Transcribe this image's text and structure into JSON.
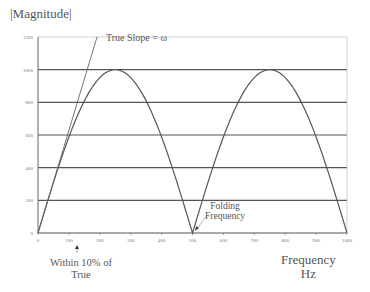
{
  "chart_data": {
    "type": "line",
    "title": "|Magnitude|",
    "xlabel": "Frequency Hz",
    "ylabel": "|Magnitude|",
    "xlim": [
      0,
      1000
    ],
    "ylim": [
      0,
      1200
    ],
    "x_ticks": [
      0,
      100,
      200,
      300,
      400,
      500,
      600,
      700,
      800,
      900,
      1000
    ],
    "y_ticks": [
      0,
      200,
      400,
      600,
      800,
      1000,
      1200
    ],
    "grid": {
      "horizontal": true,
      "vertical": false
    },
    "series": [
      {
        "name": "Aliased magnitude |1000·sin(2πf/1000)|",
        "x": [
          0,
          50,
          100,
          150,
          200,
          250,
          300,
          350,
          400,
          450,
          500,
          550,
          600,
          650,
          700,
          750,
          800,
          850,
          900,
          950,
          1000
        ],
        "values": [
          0,
          309,
          588,
          809,
          951,
          1000,
          951,
          809,
          588,
          309,
          0,
          309,
          588,
          809,
          951,
          1000,
          951,
          809,
          588,
          309,
          0
        ]
      },
      {
        "name": "True Slope = ω",
        "x": [
          0,
          191
        ],
        "values": [
          0,
          1200
        ]
      }
    ],
    "annotations": [
      {
        "text": "True Slope = ω",
        "x": 220,
        "y": 1180
      },
      {
        "text": "Folding Frequency",
        "x": 500,
        "y": 0,
        "label_at": [
          560,
          110
        ]
      },
      {
        "text": "Within 10% of True",
        "x": 130,
        "y": 0,
        "marker": "arrow-up"
      }
    ],
    "legend": null
  },
  "labels": {
    "title": "|Magnitude|",
    "true_slope": "True Slope = ω",
    "folding_1": "Folding",
    "folding_2": "Frequency",
    "within_1": "Within 10% of",
    "within_2": "True",
    "freq_1": "Frequency",
    "freq_2": "Hz"
  },
  "colors": {
    "grid": "#555555",
    "curve": "#555555",
    "axis": "#666666",
    "text": "#555555"
  }
}
